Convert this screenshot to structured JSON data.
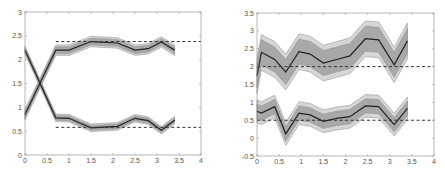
{
  "chart_data": [
    {
      "type": "line",
      "title": "",
      "xlabel": "",
      "ylabel": "",
      "xlim": [
        0,
        4
      ],
      "ylim": [
        0,
        3
      ],
      "xticks": [
        "0",
        "0.5",
        "1",
        "1.5",
        "2",
        "2.5",
        "3",
        "3.5",
        "4"
      ],
      "yticks": [
        "0",
        "0.5",
        "1",
        "1.5",
        "2",
        "2.5",
        "3"
      ],
      "grid": false,
      "legend": null,
      "x": [
        0,
        0.7,
        1.0,
        1.5,
        2.1,
        2.5,
        2.8,
        3.1,
        3.4
      ],
      "series": [
        {
          "name": "upper estimate",
          "values": [
            0.85,
            2.2,
            2.2,
            2.38,
            2.35,
            2.2,
            2.23,
            2.37,
            2.2
          ],
          "band_inner": 0.07,
          "band_outer": 0.11
        },
        {
          "name": "lower estimate",
          "values": [
            2.2,
            0.78,
            0.77,
            0.57,
            0.6,
            0.77,
            0.72,
            0.52,
            0.73
          ],
          "band_inner": 0.05,
          "band_outer": 0.08
        },
        {
          "name": "upper reference",
          "style": "dashed",
          "x": [
            0.7,
            4.0
          ],
          "values": [
            2.38,
            2.38
          ]
        },
        {
          "name": "lower reference",
          "style": "dashed",
          "x": [
            0.7,
            4.0
          ],
          "values": [
            0.58,
            0.58
          ]
        }
      ]
    },
    {
      "type": "line",
      "title": "",
      "xlabel": "",
      "ylabel": "",
      "xlim": [
        0,
        4
      ],
      "ylim": [
        -0.5,
        3.5
      ],
      "xticks": [
        "0",
        "0.5",
        "1",
        "1.5",
        "2",
        "2.5",
        "3",
        "3.5",
        "4"
      ],
      "yticks": [
        "-0.5",
        "0",
        "0.5",
        "1",
        "1.5",
        "2",
        "2.5",
        "3",
        "3.5"
      ],
      "grid": false,
      "legend": null,
      "x": [
        0,
        0.1,
        0.4,
        0.65,
        0.95,
        1.2,
        1.5,
        1.8,
        2.1,
        2.45,
        2.75,
        3.1,
        3.4
      ],
      "series": [
        {
          "name": "upper estimate",
          "values": [
            1.75,
            2.4,
            2.2,
            1.85,
            2.42,
            2.35,
            2.1,
            2.2,
            2.3,
            2.78,
            2.75,
            2.05,
            2.72
          ],
          "band_inner": 0.35,
          "band_outer": 0.5
        },
        {
          "name": "lower estimate",
          "values": [
            0.75,
            0.7,
            0.88,
            0.12,
            0.7,
            0.65,
            0.47,
            0.55,
            0.6,
            0.9,
            0.88,
            0.38,
            0.83
          ],
          "band_inner": 0.2,
          "band_outer": 0.32
        },
        {
          "name": "upper reference",
          "style": "dashed",
          "x": [
            0,
            4
          ],
          "values": [
            2.0,
            2.0
          ]
        },
        {
          "name": "lower reference",
          "style": "dashed",
          "x": [
            0,
            4
          ],
          "values": [
            0.5,
            0.5
          ]
        }
      ]
    }
  ],
  "axes": [
    {
      "box": {
        "left": 25,
        "right": 201,
        "top": 12,
        "bottom": 155
      }
    },
    {
      "box": {
        "left": 257,
        "right": 434,
        "top": 13,
        "bottom": 156
      }
    }
  ],
  "colors": {
    "axis": "#888888",
    "mean_line": "#222222",
    "band_inner": "#a8a8a8",
    "band_outer": "#d6d6d6",
    "band_edge": "#888888",
    "reference": "#333333"
  }
}
